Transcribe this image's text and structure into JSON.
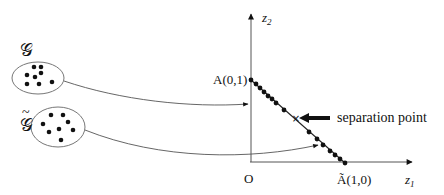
{
  "diagram": {
    "colors": {
      "ink": "#111111",
      "thin_line": "#555555",
      "ellipse_stroke": "#777777",
      "background": "#ffffff"
    },
    "sets": [
      {
        "id": "g",
        "label": "𝒢",
        "ellipse": {
          "cx": 38,
          "cy": 78,
          "rx": 26,
          "ry": 16
        },
        "label_pos": {
          "x": 20,
          "y": 56
        },
        "points": [
          [
            34,
            67
          ],
          [
            41,
            67
          ],
          [
            27,
            75
          ],
          [
            35,
            77
          ],
          [
            41,
            73
          ],
          [
            27,
            84
          ],
          [
            39,
            84
          ],
          [
            52,
            82
          ]
        ],
        "arrow_target": {
          "x": 248,
          "y": 104
        }
      },
      {
        "id": "g-tilde",
        "label": "𝒢",
        "tilde": "~",
        "ellipse": {
          "cx": 58,
          "cy": 127,
          "rx": 27,
          "ry": 20
        },
        "label_pos": {
          "x": 20,
          "y": 131
        },
        "points": [
          [
            51,
            115
          ],
          [
            63,
            115
          ],
          [
            43,
            124
          ],
          [
            68,
            122
          ],
          [
            49,
            132
          ],
          [
            59,
            129
          ],
          [
            73,
            130
          ],
          [
            61,
            140
          ]
        ],
        "arrow_target": {
          "x": 318,
          "y": 145
        }
      }
    ],
    "axes": {
      "origin": {
        "x": 250,
        "y": 162
      },
      "z1_end": {
        "x": 412,
        "y": 162
      },
      "z2_end": {
        "x": 251,
        "y": 14
      },
      "z1_label": "z",
      "z1_sub": "1",
      "z2_label": "z",
      "z2_sub": "2",
      "origin_label": "O"
    },
    "segment": {
      "A": {
        "x": 251,
        "y": 80,
        "label": "A(0,1)"
      },
      "A_tilde": {
        "x": 345,
        "y": 163,
        "label": "Ã(1,0)"
      },
      "points": [
        [
          251,
          80
        ],
        [
          256,
          84
        ],
        [
          260,
          88
        ],
        [
          264,
          92
        ],
        [
          268,
          96
        ],
        [
          272,
          99
        ],
        [
          276,
          103
        ],
        [
          284,
          110
        ],
        [
          309,
          132
        ],
        [
          317,
          139
        ],
        [
          323,
          145
        ],
        [
          330,
          151
        ],
        [
          335,
          155
        ],
        [
          340,
          159
        ],
        [
          345,
          163
        ]
      ],
      "separation": {
        "x": 296,
        "y": 118,
        "label": "separation point",
        "marker": "×"
      }
    }
  }
}
